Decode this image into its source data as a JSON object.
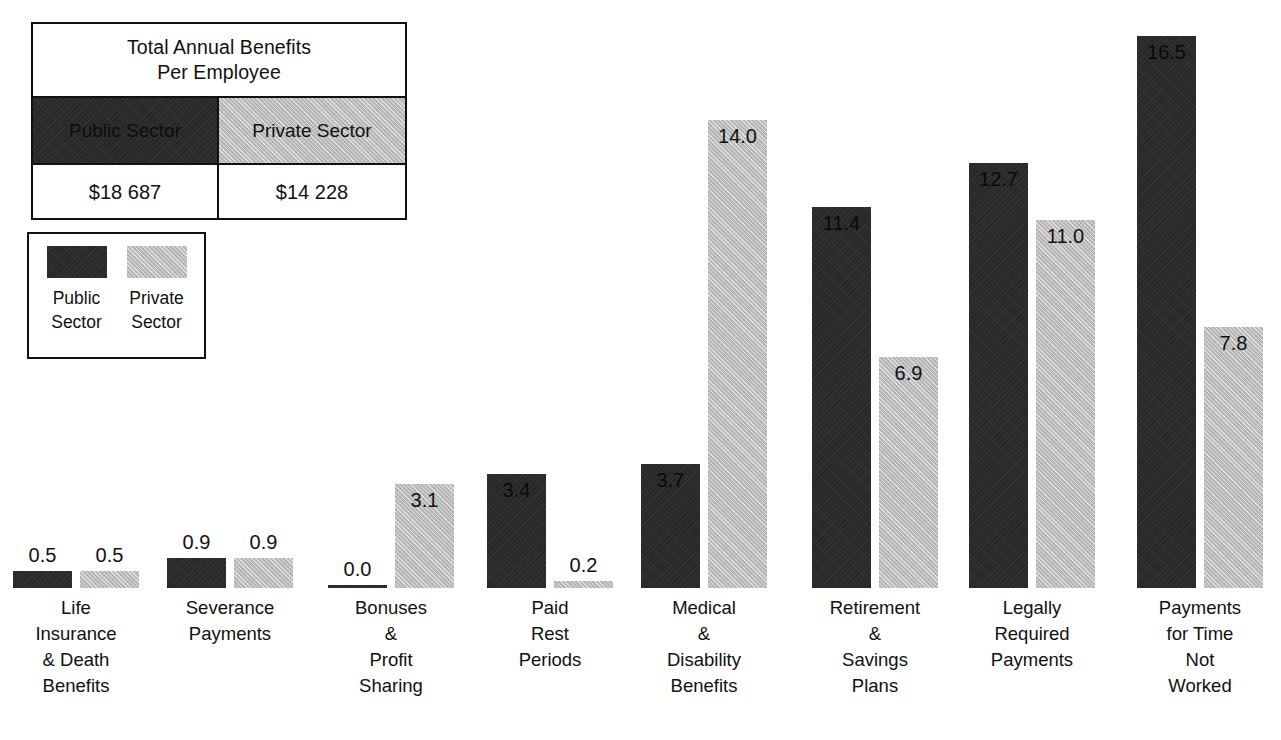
{
  "summary_table": {
    "title_line1": "Total Annual Benefits",
    "title_line2": "Per Employee",
    "public_header": "Public Sector",
    "private_header": "Private Sector",
    "public_value": "$18 687",
    "private_value": "$14 228"
  },
  "legend": {
    "public_line1": "Public",
    "public_line2": "Sector",
    "private_line1": "Private",
    "private_line2": "Sector"
  },
  "colors": {
    "public": "#272727",
    "private": "#b9b9b9",
    "ink": "#111111",
    "background": "#ffffff"
  },
  "chart_data": {
    "type": "bar",
    "title": "",
    "xlabel": "",
    "ylabel": "",
    "ylim": [
      0,
      16.5
    ],
    "grid": false,
    "legend_position": "top-left",
    "categories": [
      "Life Insurance & Death Benefits",
      "Severance Payments",
      "Bonuses & Profit Sharing",
      "Paid Rest Periods",
      "Medical & Disability Benefits",
      "Retirement & Savings Plans",
      "Legally Required Payments",
      "Payments for Time Not Worked"
    ],
    "category_label_lines": [
      [
        "Life",
        "Insurance",
        "& Death",
        "Benefits"
      ],
      [
        "Severance",
        "Payments"
      ],
      [
        "Bonuses",
        "&",
        "Profit",
        "Sharing"
      ],
      [
        "Paid",
        "Rest",
        "Periods"
      ],
      [
        "Medical",
        "&",
        "Disability",
        "Benefits"
      ],
      [
        "Retirement",
        "&",
        "Savings",
        "Plans"
      ],
      [
        "Legally",
        "Required",
        "Payments"
      ],
      [
        "Payments",
        "for Time",
        "Not",
        "Worked"
      ]
    ],
    "series": [
      {
        "name": "Public Sector",
        "values": [
          0.5,
          0.9,
          0.0,
          3.4,
          3.7,
          11.4,
          12.7,
          16.5
        ],
        "labels": [
          "0.5",
          "0.9",
          "0.0",
          "3.4",
          "3.7",
          "11.4",
          "12.7",
          "16.5"
        ]
      },
      {
        "name": "Private Sector",
        "values": [
          0.5,
          0.9,
          3.1,
          0.2,
          14.0,
          6.9,
          11.0,
          7.8
        ],
        "labels": [
          "0.5",
          "0.9",
          "3.1",
          "0.2",
          "14.0",
          "6.9",
          "11.0",
          "7.8"
        ]
      }
    ]
  }
}
